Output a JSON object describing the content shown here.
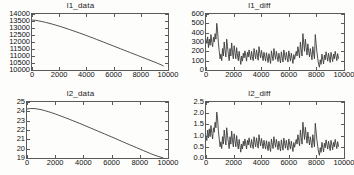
{
  "figure": {
    "background_color": "#fdfdfc",
    "axis_color": "#5a5a5a",
    "line_color": "#3c3c3c",
    "rows": 2,
    "cols": 2
  },
  "chart_data": [
    {
      "type": "line",
      "name": "l1_data",
      "title": "l1_data",
      "xlabel": "",
      "ylabel": "",
      "xlim": [
        0,
        10000
      ],
      "ylim": [
        10000,
        14000
      ],
      "xticks": [
        0,
        2000,
        4000,
        6000,
        8000,
        10000
      ],
      "xticklabels": [
        "0",
        "2000",
        "4000",
        "6000",
        "8000",
        "10000"
      ],
      "yticks": [
        10000,
        10500,
        11000,
        11500,
        12000,
        12500,
        13000,
        13500,
        14000
      ],
      "yticklabels": [
        "10000",
        "10500",
        "11000",
        "11500",
        "12000",
        "12500",
        "13000",
        "13500",
        "14000"
      ],
      "grid": false,
      "legend": null,
      "x": [
        0,
        250,
        500,
        750,
        1000,
        1250,
        1500,
        1750,
        2000,
        2250,
        2500,
        2750,
        3000,
        3250,
        3500,
        3750,
        4000,
        4250,
        4500,
        4750,
        5000,
        5250,
        5500,
        5750,
        6000,
        6250,
        6500,
        6750,
        7000,
        7250,
        7500,
        7750,
        8000,
        8250,
        8500,
        8750,
        9000,
        9250,
        9500,
        9650
      ],
      "values": [
        13570,
        13545,
        13505,
        13455,
        13400,
        13340,
        13275,
        13205,
        13130,
        13055,
        12975,
        12895,
        12810,
        12725,
        12640,
        12550,
        12460,
        12370,
        12280,
        12185,
        12090,
        11995,
        11900,
        11805,
        11710,
        11615,
        11520,
        11425,
        11330,
        11235,
        11140,
        11045,
        10950,
        10855,
        10760,
        10665,
        10570,
        10470,
        10370,
        10290
      ]
    },
    {
      "type": "line",
      "name": "l1_diff",
      "title": "l1_diff",
      "xlabel": "",
      "ylabel": "",
      "xlim": [
        0,
        10000
      ],
      "ylim": [
        0,
        600
      ],
      "xticks": [
        0,
        2000,
        4000,
        6000,
        8000,
        10000
      ],
      "xticklabels": [
        "0",
        "2000",
        "4000",
        "6000",
        "8000",
        "10000"
      ],
      "yticks": [
        0,
        100,
        200,
        300,
        400,
        500,
        600
      ],
      "yticklabels": [
        "0",
        "100",
        "200",
        "300",
        "400",
        "500",
        "600"
      ],
      "grid": false,
      "legend": null,
      "x": [
        0,
        60,
        120,
        180,
        240,
        300,
        360,
        420,
        480,
        540,
        600,
        660,
        720,
        780,
        840,
        900,
        960,
        1020,
        1080,
        1140,
        1200,
        1260,
        1320,
        1380,
        1440,
        1500,
        1560,
        1620,
        1680,
        1740,
        1800,
        1860,
        1920,
        1980,
        2040,
        2100,
        2160,
        2220,
        2280,
        2340,
        2400,
        2460,
        2520,
        2580,
        2640,
        2700,
        2760,
        2820,
        2880,
        2940,
        3000,
        3060,
        3120,
        3180,
        3240,
        3300,
        3360,
        3420,
        3480,
        3540,
        3600,
        3660,
        3720,
        3780,
        3840,
        3900,
        3960,
        4020,
        4080,
        4140,
        4200,
        4260,
        4320,
        4380,
        4440,
        4500,
        4560,
        4620,
        4680,
        4740,
        4800,
        4860,
        4920,
        4980,
        5040,
        5100,
        5160,
        5220,
        5280,
        5340,
        5400,
        5460,
        5520,
        5580,
        5640,
        5700,
        5760,
        5820,
        5880,
        5940,
        6000,
        6060,
        6120,
        6180,
        6240,
        6300,
        6360,
        6420,
        6480,
        6540,
        6600,
        6660,
        6720,
        6780,
        6840,
        6900,
        6960,
        7020,
        7080,
        7140,
        7200,
        7260,
        7320,
        7380,
        7440,
        7500,
        7560,
        7620,
        7680,
        7740,
        7800,
        7860,
        7920,
        7980,
        8040,
        8100,
        8160,
        8220,
        8280,
        8340,
        8400,
        8460,
        8520,
        8580,
        8640,
        8700,
        8760,
        8820,
        8880,
        8940,
        9000,
        9060,
        9120,
        9180,
        9240,
        9300,
        9360,
        9420,
        9480,
        9540,
        9600,
        9660
      ],
      "values": [
        330,
        285,
        355,
        240,
        330,
        265,
        380,
        295,
        250,
        350,
        300,
        390,
        330,
        500,
        420,
        290,
        200,
        120,
        170,
        100,
        230,
        150,
        300,
        210,
        140,
        330,
        250,
        170,
        100,
        230,
        150,
        290,
        190,
        120,
        260,
        190,
        120,
        240,
        160,
        100,
        200,
        130,
        60,
        150,
        95,
        180,
        130,
        205,
        150,
        95,
        190,
        140,
        215,
        160,
        110,
        200,
        145,
        100,
        230,
        170,
        120,
        215,
        160,
        105,
        250,
        180,
        130,
        210,
        155,
        100,
        190,
        140,
        95,
        185,
        130,
        80,
        175,
        120,
        70,
        205,
        150,
        100,
        230,
        165,
        115,
        200,
        145,
        90,
        180,
        125,
        75,
        195,
        140,
        85,
        215,
        155,
        105,
        190,
        135,
        85,
        205,
        150,
        95,
        180,
        125,
        70,
        165,
        115,
        160,
        200,
        150,
        250,
        190,
        130,
        300,
        220,
        150,
        390,
        290,
        200,
        330,
        240,
        160,
        280,
        200,
        140,
        230,
        170,
        110,
        250,
        180,
        120,
        380,
        280,
        190,
        120,
        60,
        30,
        110,
        60,
        170,
        115,
        65,
        160,
        110,
        195,
        145,
        95,
        180,
        130,
        80,
        190,
        140,
        90,
        170,
        120,
        200,
        150,
        100,
        175,
        125
      ]
    },
    {
      "type": "line",
      "name": "l2_data",
      "title": "l2_data",
      "xlabel": "",
      "ylabel": "",
      "xlim": [
        0,
        10000
      ],
      "ylim": [
        19,
        25
      ],
      "xticks": [
        0,
        2000,
        4000,
        6000,
        8000,
        10000
      ],
      "xticklabels": [
        "0",
        "2000",
        "4000",
        "6000",
        "8000",
        "10000"
      ],
      "yticks": [
        19,
        20,
        21,
        22,
        23,
        24,
        25
      ],
      "yticklabels": [
        "19",
        "20",
        "21",
        "22",
        "23",
        "24",
        "25"
      ],
      "grid": false,
      "legend": null,
      "x": [
        0,
        250,
        500,
        750,
        1000,
        1250,
        1500,
        1750,
        2000,
        2250,
        2500,
        2750,
        3000,
        3250,
        3500,
        3750,
        4000,
        4250,
        4500,
        4750,
        5000,
        5250,
        5500,
        5750,
        6000,
        6250,
        6500,
        6750,
        7000,
        7250,
        7500,
        7750,
        8000,
        8250,
        8500,
        8750,
        9000,
        9250,
        9500,
        9650
      ],
      "values": [
        24.25,
        24.3,
        24.3,
        24.25,
        24.18,
        24.08,
        23.97,
        23.85,
        23.72,
        23.58,
        23.44,
        23.3,
        23.15,
        23.0,
        22.85,
        22.7,
        22.54,
        22.38,
        22.22,
        22.06,
        21.9,
        21.74,
        21.58,
        21.42,
        21.26,
        21.1,
        20.93,
        20.77,
        20.6,
        20.44,
        20.28,
        20.12,
        19.96,
        19.8,
        19.64,
        19.48,
        19.33,
        19.2,
        19.08,
        19.0
      ]
    },
    {
      "type": "line",
      "name": "l2_diff",
      "title": "l2_diff",
      "xlabel": "",
      "ylabel": "",
      "xlim": [
        0,
        10000
      ],
      "ylim": [
        0.0,
        2.5
      ],
      "xticks": [
        0,
        2000,
        4000,
        6000,
        8000,
        10000
      ],
      "xticklabels": [
        "0",
        "2000",
        "4000",
        "6000",
        "8000",
        "10000"
      ],
      "yticks": [
        0.0,
        0.5,
        1.0,
        1.5,
        2.0,
        2.5
      ],
      "yticklabels": [
        "0.0",
        "0.5",
        "1.0",
        "1.5",
        "2.0",
        "2.5"
      ],
      "grid": false,
      "legend": null,
      "x": [
        0,
        60,
        120,
        180,
        240,
        300,
        360,
        420,
        480,
        540,
        600,
        660,
        720,
        780,
        840,
        900,
        960,
        1020,
        1080,
        1140,
        1200,
        1260,
        1320,
        1380,
        1440,
        1500,
        1560,
        1620,
        1680,
        1740,
        1800,
        1860,
        1920,
        1980,
        2040,
        2100,
        2160,
        2220,
        2280,
        2340,
        2400,
        2460,
        2520,
        2580,
        2640,
        2700,
        2760,
        2820,
        2880,
        2940,
        3000,
        3060,
        3120,
        3180,
        3240,
        3300,
        3360,
        3420,
        3480,
        3540,
        3600,
        3660,
        3720,
        3780,
        3840,
        3900,
        3960,
        4020,
        4080,
        4140,
        4200,
        4260,
        4320,
        4380,
        4440,
        4500,
        4560,
        4620,
        4680,
        4740,
        4800,
        4860,
        4920,
        4980,
        5040,
        5100,
        5160,
        5220,
        5280,
        5340,
        5400,
        5460,
        5520,
        5580,
        5640,
        5700,
        5760,
        5820,
        5880,
        5940,
        6000,
        6060,
        6120,
        6180,
        6240,
        6300,
        6360,
        6420,
        6480,
        6540,
        6600,
        6660,
        6720,
        6780,
        6840,
        6900,
        6960,
        7020,
        7080,
        7140,
        7200,
        7260,
        7320,
        7380,
        7440,
        7500,
        7560,
        7620,
        7680,
        7740,
        7800,
        7860,
        7920,
        7980,
        8040,
        8100,
        8160,
        8220,
        8280,
        8340,
        8400,
        8460,
        8520,
        8580,
        8640,
        8700,
        8760,
        8820,
        8880,
        8940,
        9000,
        9060,
        9120,
        9180,
        9240,
        9300,
        9360,
        9420,
        9480,
        9540,
        9600,
        9660
      ],
      "values": [
        1.0,
        0.78,
        1.25,
        0.9,
        1.3,
        0.95,
        1.45,
        1.1,
        0.85,
        1.35,
        1.15,
        1.6,
        1.35,
        2.05,
        1.75,
        1.2,
        0.85,
        0.5,
        0.72,
        0.42,
        0.95,
        0.62,
        1.25,
        0.88,
        0.58,
        1.35,
        1.0,
        0.7,
        0.42,
        0.95,
        0.62,
        1.2,
        0.8,
        0.5,
        1.08,
        0.78,
        0.5,
        1.0,
        0.66,
        0.4,
        0.83,
        0.54,
        0.26,
        0.62,
        0.4,
        0.75,
        0.54,
        0.85,
        0.62,
        0.4,
        0.79,
        0.58,
        0.9,
        0.66,
        0.46,
        0.83,
        0.6,
        0.42,
        0.95,
        0.7,
        0.5,
        0.9,
        0.66,
        0.44,
        1.04,
        0.75,
        0.54,
        0.87,
        0.64,
        0.42,
        0.79,
        0.58,
        0.4,
        0.77,
        0.54,
        0.33,
        0.73,
        0.5,
        0.29,
        0.85,
        0.62,
        0.42,
        0.95,
        0.69,
        0.48,
        0.83,
        0.6,
        0.37,
        0.75,
        0.52,
        0.31,
        0.81,
        0.58,
        0.35,
        0.89,
        0.64,
        0.44,
        0.79,
        0.56,
        0.35,
        0.85,
        0.62,
        0.4,
        0.75,
        0.52,
        0.29,
        0.69,
        0.48,
        0.66,
        0.83,
        0.62,
        1.04,
        0.79,
        0.54,
        1.25,
        0.92,
        0.62,
        1.6,
        1.2,
        0.83,
        1.37,
        1.0,
        0.66,
        1.16,
        0.83,
        0.58,
        0.95,
        0.7,
        0.46,
        1.04,
        0.75,
        0.5,
        1.55,
        1.16,
        0.79,
        0.5,
        0.25,
        0.12,
        0.46,
        0.25,
        0.7,
        0.48,
        0.27,
        0.66,
        0.46,
        0.81,
        0.6,
        0.4,
        0.75,
        0.54,
        0.33,
        0.79,
        0.58,
        0.37,
        0.7,
        0.5,
        0.83,
        0.62,
        0.42,
        0.73,
        0.52
      ]
    }
  ]
}
